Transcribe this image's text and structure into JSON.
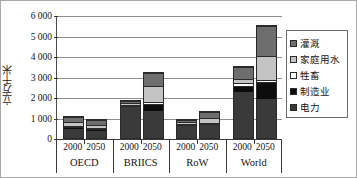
{
  "chart_data": {
    "type": "bar",
    "subtype": "stacked-bar-grouped",
    "title": "",
    "xlabel": "",
    "ylabel": "立方千米",
    "ylim": [
      0,
      6000
    ],
    "ytick_labels": [
      "0",
      "1 000",
      "2 000",
      "3 000",
      "4 000",
      "5 000",
      "6 000"
    ],
    "ytick_values": [
      0,
      1000,
      2000,
      3000,
      4000,
      5000,
      6000
    ],
    "grid": true,
    "legend_position": "right",
    "groups": [
      "OECD",
      "BRIICS",
      "RoW",
      "World"
    ],
    "years": [
      "2000",
      "2050"
    ],
    "categories": [
      "OECD 2000",
      "OECD 2050",
      "BRIICS 2000",
      "BRIICS 2050",
      "RoW 2000",
      "RoW 2050",
      "World 2000",
      "World 2050"
    ],
    "series": [
      {
        "name": "电力",
        "color": "#3a3a3a",
        "values": [
          500,
          370,
          1580,
          1380,
          690,
          680,
          2320,
          1960
        ]
      },
      {
        "name": "制造业",
        "color": "#0d0d0d",
        "values": [
          120,
          100,
          60,
          350,
          50,
          60,
          280,
          800
        ]
      },
      {
        "name": "牲畜",
        "color": "#ffffff",
        "values": [
          50,
          50,
          60,
          60,
          50,
          60,
          140,
          130
        ]
      },
      {
        "name": "家庭用水",
        "color": "#c4c4c4",
        "values": [
          160,
          160,
          90,
          810,
          80,
          230,
          200,
          1200
        ]
      },
      {
        "name": "灌溉",
        "color": "#6e6e6e",
        "values": [
          300,
          300,
          90,
          680,
          100,
          320,
          640,
          1470
        ]
      }
    ],
    "totals": [
      1130,
      980,
      1880,
      3280,
      970,
      1350,
      3580,
      5560
    ]
  },
  "legend": {
    "items": [
      {
        "label": "灌溉",
        "color": "#6e6e6e"
      },
      {
        "label": "家庭用水",
        "color": "#c4c4c4"
      },
      {
        "label": "牲畜",
        "color": "#ffffff"
      },
      {
        "label": "制造业",
        "color": "#0d0d0d"
      },
      {
        "label": "电力",
        "color": "#3a3a3a"
      }
    ]
  },
  "axis": {
    "y_title": "立方千米",
    "y_labels": [
      "6 000",
      "5 000",
      "4 000",
      "3 000",
      "2 000",
      "1 000",
      "0"
    ],
    "x_years": [
      "2000",
      "2050",
      "2000",
      "2050",
      "2000",
      "2050",
      "2000",
      "2050"
    ],
    "x_regions": [
      "OECD",
      "BRIICS",
      "RoW",
      "World"
    ]
  }
}
